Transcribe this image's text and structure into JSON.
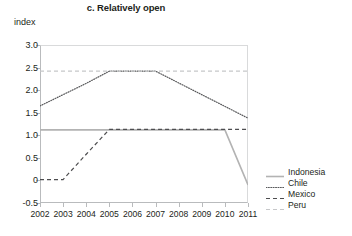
{
  "chart_data": {
    "type": "line",
    "title": "c. Relatively open",
    "xlabel": "",
    "ylabel": "index",
    "x": [
      2002,
      2003,
      2004,
      2005,
      2006,
      2007,
      2008,
      2009,
      2010,
      2011
    ],
    "categories": [
      "2002",
      "2003",
      "2004",
      "2005",
      "2006",
      "2007",
      "2008",
      "2009",
      "2010",
      "2011"
    ],
    "ylim": [
      -0.5,
      3.0
    ],
    "yticks": [
      3.0,
      2.5,
      2.0,
      1.5,
      1.0,
      0.5,
      0,
      -0.5
    ],
    "ytick_labels": [
      "3.0",
      "2.5",
      "2.0",
      "1.5",
      "1.0",
      "0.5",
      "0",
      "-0.5"
    ],
    "grid": false,
    "legend_position": "right",
    "series": [
      {
        "name": "Indonesia",
        "style": "solid",
        "color": "#b3b3b3",
        "values": [
          1.12,
          1.12,
          1.12,
          1.12,
          1.12,
          1.12,
          1.12,
          1.12,
          1.12,
          -0.1
        ]
      },
      {
        "name": "Chile",
        "style": "dotted",
        "color": "#58595b",
        "values": [
          1.65,
          1.9,
          2.15,
          2.42,
          2.42,
          2.42,
          2.16,
          1.9,
          1.64,
          1.38
        ]
      },
      {
        "name": "Mexico",
        "style": "dashed",
        "color": "#4d4d4f",
        "values": [
          0.02,
          0.02,
          0.58,
          1.13,
          1.13,
          1.13,
          1.13,
          1.13,
          1.13,
          1.13
        ]
      },
      {
        "name": "Peru",
        "style": "dashed",
        "color": "#c6c7c9",
        "values": [
          2.42,
          2.42,
          2.42,
          2.42,
          2.42,
          2.42,
          2.42,
          2.42,
          2.42,
          2.42
        ]
      }
    ]
  },
  "legend": {
    "items": [
      {
        "label": "Indonesia"
      },
      {
        "label": "Chile"
      },
      {
        "label": "Mexico"
      },
      {
        "label": "Peru"
      }
    ]
  },
  "colors": {
    "axis": "#b9bbbd",
    "frame_light": "#d9dadb",
    "text": "#231f20"
  }
}
